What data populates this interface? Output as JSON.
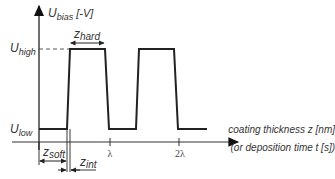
{
  "diagram": {
    "y_axis_label": {
      "main": "U",
      "sub": "bias",
      "unit": " [-V]"
    },
    "levels": {
      "high": {
        "main": "U",
        "sub": "high"
      },
      "low": {
        "main": "U",
        "sub": "low"
      }
    },
    "x_axis_label_line1": "coating thickness z [nm]",
    "x_axis_label_line2": "(or deposition time t [s])",
    "ticks": [
      "λ",
      "2λ"
    ],
    "dimensions": {
      "hard": {
        "main": "z",
        "sub": "hard"
      },
      "soft": {
        "main": "z",
        "sub": "soft"
      },
      "int": {
        "main": "z",
        "sub": "int"
      }
    },
    "colors": {
      "line": "#222222",
      "text": "#333333"
    }
  }
}
